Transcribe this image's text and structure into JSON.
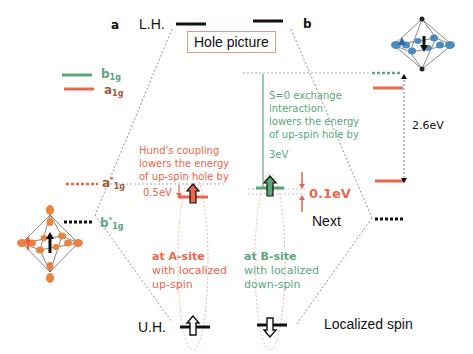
{
  "panels": {
    "a_label": "a",
    "b_label": "b"
  },
  "levels": {
    "lower_hubbard": "L.H.",
    "upper_hubbard": "U.H."
  },
  "title_box": "Hole picture",
  "legend": {
    "b1g": {
      "symbol": "b",
      "sub": "1g",
      "color": "#5aa77a"
    },
    "a1g": {
      "symbol": "a",
      "sub": "1g",
      "color": "#e8664a"
    }
  },
  "left_levels": {
    "a1g_star": {
      "symbol": "a",
      "sup": "*",
      "sub": "1g"
    },
    "b1g_star": {
      "symbol": "b",
      "sup": "*",
      "sub": "1g"
    }
  },
  "annotations": {
    "hund": {
      "lines": [
        "Hund's  coupling",
        "lowers the energy",
        "of up-spin hole by"
      ],
      "value": "0.5eV"
    },
    "exchange": {
      "lines": [
        "S=0 exchange",
        "interaction",
        "lowers the energy",
        "of up-spin hole by"
      ],
      "value": "3eV"
    },
    "gap_small": "0.1eV",
    "gap_large": "2.6eV",
    "next": "Next",
    "localized_spin": "Localized spin",
    "a_site": {
      "title": "at A-site",
      "lines": [
        "with localized",
        "up-spin"
      ]
    },
    "b_site": {
      "title": "at B-site",
      "lines": [
        "with localized",
        "down-spin"
      ]
    }
  },
  "colors": {
    "orange": "#e8664a",
    "green": "#5aa77a",
    "blue": "#4a8cc0",
    "black": "#111111",
    "box_border": "#d99a8a"
  },
  "icons": {
    "octahedron_a": "orange-octahedron-up-spin",
    "octahedron_b": "blue-octahedron-down-spin"
  }
}
